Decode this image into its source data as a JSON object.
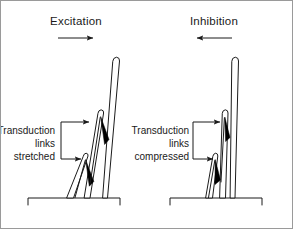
{
  "figure": {
    "title_left": "Excitation",
    "title_right": "Inhibition",
    "border_color": "#9a9a9a",
    "ink_color": "#1b1b1b",
    "background_color": "#ffffff",
    "link_fill_color": "#000000"
  },
  "panels": {
    "left": {
      "heading": "Excitation",
      "direction_arrow": "arrow-right",
      "caption_line1": "Transduction",
      "caption_line2": "links",
      "caption_line3": "stretched",
      "bundle_tilt_degrees": 12,
      "stereocilia_count": 3,
      "transduction_link_count": 2,
      "state": "stretched"
    },
    "right": {
      "heading": "Inhibition",
      "direction_arrow": "arrow-left",
      "caption_line1": "Transduction",
      "caption_line2": "links",
      "caption_line3": "compressed",
      "bundle_tilt_degrees": 4,
      "stereocilia_count": 3,
      "transduction_link_count": 2,
      "state": "compressed"
    }
  },
  "icons": {
    "arrow_right": "arrow-right-icon",
    "arrow_left": "arrow-left-icon",
    "bracket": "bracket-icon"
  }
}
